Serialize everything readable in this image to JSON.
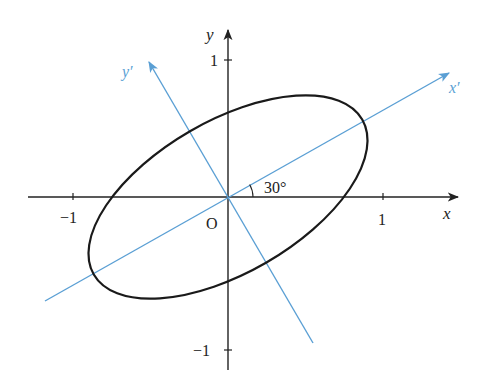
{
  "figure": {
    "colors": {
      "axes": "#222222",
      "ellipse": "#1a1a1a",
      "rotated_axes": "#5a9fd4",
      "background": "#ffffff"
    },
    "axes": {
      "x_label": "x",
      "y_label": "y",
      "origin_label": "O",
      "x_ticks": [
        {
          "value": -1,
          "label": "−1"
        },
        {
          "value": 1,
          "label": "1"
        }
      ],
      "y_ticks": [
        {
          "value": 1,
          "label": "1"
        },
        {
          "value": -1,
          "label": "−1"
        }
      ]
    },
    "rotated_axes": {
      "x_prime_label": "x′",
      "y_prime_label": "y′",
      "angle_deg": 30,
      "angle_label": "30°"
    },
    "ellipse": {
      "center": [
        0,
        0
      ],
      "rotation_deg": 30,
      "semi_major": 1.0,
      "semi_minor": 0.49
    }
  }
}
